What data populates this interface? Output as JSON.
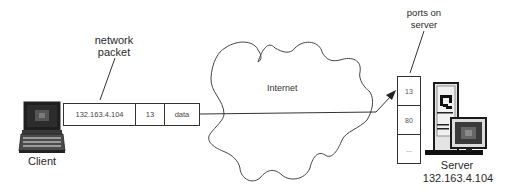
{
  "diagram": {
    "type": "network-diagram",
    "labels": {
      "packet_caption_line1": "network",
      "packet_caption_line2": "packet",
      "ports_caption_line1": "ports on",
      "ports_caption_line2": "server",
      "cloud": "Internet",
      "client": "Client",
      "server": "Server",
      "server_ip": "132.163.4.104"
    },
    "packet": {
      "fields": [
        {
          "name": "destination-ip",
          "value": "132.163.4.104"
        },
        {
          "name": "destination-port",
          "value": "13"
        },
        {
          "name": "payload",
          "value": "data"
        }
      ]
    },
    "server_ports": [
      {
        "value": "13"
      },
      {
        "value": "80"
      },
      {
        "value": "..."
      }
    ],
    "nodes": [
      {
        "id": "client",
        "icon": "laptop-icon",
        "label": "Client"
      },
      {
        "id": "internet",
        "icon": "cloud-icon",
        "label": "Internet"
      },
      {
        "id": "server",
        "icon": "server-computer-icon",
        "label": "Server",
        "ip": "132.163.4.104"
      }
    ],
    "edges": [
      {
        "from": "client",
        "to": "internet",
        "via": "network packet"
      },
      {
        "from": "internet",
        "to": "server",
        "target_port": "13",
        "arrow": true
      }
    ],
    "colors": {
      "stroke": "#333333",
      "text": "#2a2a2a",
      "background": "#ffffff"
    }
  }
}
